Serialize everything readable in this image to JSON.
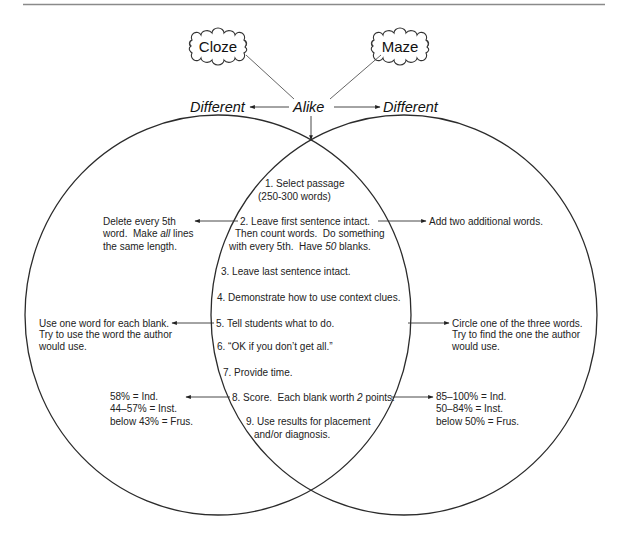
{
  "diagram": {
    "clouds": {
      "cloze": "Cloze",
      "maze": "Maze"
    },
    "header": {
      "left_label": "Different",
      "center_label": "Alike",
      "right_label": "Different"
    },
    "shared_steps": {
      "step1": {
        "line1": "1. Select passage",
        "line2": "(250-300 words)"
      },
      "step2": {
        "line1": "2. Leave first sentence intact.",
        "line2": "Then count words.  Do something",
        "line3_pre": "with every 5th.  Have ",
        "line3_em": "50",
        "line3_post": " blanks."
      },
      "step3": "3. Leave last sentence intact.",
      "step4": "4. Demonstrate how to use context clues.",
      "step5": "5. Tell students what to do.",
      "step6": "6. “OK if you don’t get all.”",
      "step7": "7. Provide time.",
      "step8": {
        "pre": "8. Score.  Each blank worth ",
        "em": "2",
        "post": " points."
      },
      "step9": {
        "line1": "9. Use results for placement",
        "line2": "and/or diagnosis."
      }
    },
    "cloze": {
      "construction": {
        "line1": "Delete every 5th",
        "line2_pre": "word.  Make ",
        "line2_em": "all",
        "line2_post": " lines",
        "line3": "the same length."
      },
      "instructions": {
        "line1": "Use one word for each blank.",
        "line2": "Try to use the word the author",
        "line3": "would use."
      },
      "scoring": {
        "line1": "58% = Ind.",
        "line2": "44–57% = Inst.",
        "line3": "below 43% = Frus."
      }
    },
    "maze": {
      "construction": {
        "line1": "Add two additional words."
      },
      "instructions": {
        "line1": "Circle one of the three words.",
        "line2": "Try to find the one the author",
        "line3": "would use."
      },
      "scoring": {
        "line1": "85–100% = Ind.",
        "line2": "50–84% = Inst.",
        "line3": "below 50% = Frus."
      }
    },
    "colors": {
      "stroke": "#2b2b2b",
      "text": "#222222",
      "rule": "#8a8a8a"
    }
  }
}
